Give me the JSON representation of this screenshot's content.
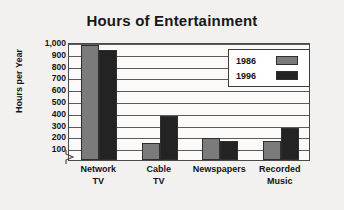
{
  "chart_data": {
    "type": "bar",
    "title": "Hours of Entertainment",
    "xlabel": "",
    "ylabel": "Hours per Year",
    "categories": [
      "Network TV",
      "Cable TV",
      "Newspapers",
      "Recorded Music"
    ],
    "category_lines": [
      [
        "Network",
        "TV"
      ],
      [
        "Cable",
        "TV"
      ],
      [
        "Newspapers",
        ""
      ],
      [
        "Recorded",
        "Music"
      ]
    ],
    "series": [
      {
        "name": "1986",
        "color": "#7b7b7b",
        "values": [
          975,
          140,
          185,
          160
        ]
      },
      {
        "name": "1996",
        "color": "#232323",
        "values": [
          935,
          370,
          165,
          275
        ]
      }
    ],
    "ylim": [
      0,
      1000
    ],
    "y_ticks": [
      100,
      200,
      300,
      400,
      500,
      600,
      700,
      800,
      900,
      1000
    ],
    "y_tick_labels": [
      "100",
      "200",
      "300",
      "400",
      "500",
      "600",
      "700",
      "800",
      "900",
      "1,000"
    ],
    "grid": true,
    "axis_break": true,
    "legend_position": "top-right"
  }
}
